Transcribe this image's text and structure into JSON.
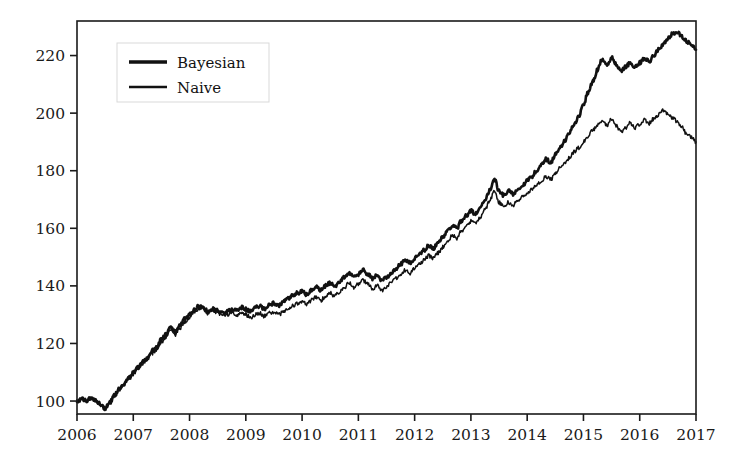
{
  "chart_data": {
    "type": "line",
    "title": "",
    "xlabel": "",
    "ylabel": "",
    "xlim": [
      2006,
      2017
    ],
    "ylim": [
      95.5,
      232
    ],
    "grid": false,
    "legend_position": "upper left",
    "xticks": [
      "2006",
      "2007",
      "2008",
      "2009",
      "2010",
      "2011",
      "2012",
      "2013",
      "2014",
      "2015",
      "2016",
      "2017"
    ],
    "yticks": [
      "100",
      "120",
      "140",
      "160",
      "180",
      "200",
      "220"
    ],
    "ytick_values": [
      100,
      120,
      140,
      160,
      180,
      200,
      220
    ],
    "xtick_values": [
      2006,
      2007,
      2008,
      2009,
      2010,
      2011,
      2012,
      2013,
      2014,
      2015,
      2016,
      2017
    ],
    "series": [
      {
        "name": "Bayesian",
        "color": "#111111",
        "linewidth": 2.6,
        "x": [
          2006.0,
          2006.08,
          2006.17,
          2006.25,
          2006.33,
          2006.42,
          2006.5,
          2006.58,
          2006.67,
          2006.75,
          2006.83,
          2006.92,
          2007.0,
          2007.08,
          2007.17,
          2007.25,
          2007.33,
          2007.42,
          2007.5,
          2007.58,
          2007.67,
          2007.75,
          2007.83,
          2007.92,
          2008.0,
          2008.08,
          2008.17,
          2008.25,
          2008.33,
          2008.42,
          2008.5,
          2008.58,
          2008.67,
          2008.75,
          2008.83,
          2008.92,
          2009.0,
          2009.08,
          2009.17,
          2009.25,
          2009.33,
          2009.42,
          2009.5,
          2009.58,
          2009.67,
          2009.75,
          2009.83,
          2009.92,
          2010.0,
          2010.08,
          2010.17,
          2010.25,
          2010.33,
          2010.42,
          2010.5,
          2010.58,
          2010.67,
          2010.75,
          2010.83,
          2010.92,
          2011.0,
          2011.08,
          2011.17,
          2011.25,
          2011.33,
          2011.42,
          2011.5,
          2011.58,
          2011.67,
          2011.75,
          2011.83,
          2011.92,
          2012.0,
          2012.08,
          2012.17,
          2012.25,
          2012.33,
          2012.42,
          2012.5,
          2012.58,
          2012.67,
          2012.75,
          2012.83,
          2012.92,
          2013.0,
          2013.08,
          2013.17,
          2013.25,
          2013.33,
          2013.42,
          2013.5,
          2013.58,
          2013.67,
          2013.75,
          2013.83,
          2013.92,
          2014.0,
          2014.08,
          2014.17,
          2014.25,
          2014.33,
          2014.42,
          2014.5,
          2014.58,
          2014.67,
          2014.75,
          2014.83,
          2014.92,
          2015.0,
          2015.08,
          2015.17,
          2015.25,
          2015.33,
          2015.42,
          2015.5,
          2015.58,
          2015.67,
          2015.75,
          2015.83,
          2015.92,
          2016.0,
          2016.08,
          2016.17,
          2016.25,
          2016.33,
          2016.42,
          2016.5,
          2016.58,
          2016.67,
          2016.75,
          2016.83,
          2016.92,
          2017.0
        ],
        "y": [
          100.0,
          100.6,
          100.2,
          101.0,
          100.4,
          99.0,
          97.2,
          99.5,
          102.0,
          104.5,
          106.0,
          108.0,
          110.0,
          111.5,
          113.5,
          115.0,
          117.5,
          119.0,
          121.5,
          123.0,
          125.5,
          124.0,
          126.5,
          128.5,
          130.0,
          131.5,
          133.0,
          132.5,
          131.0,
          132.0,
          131.5,
          130.5,
          131.0,
          132.0,
          131.5,
          132.5,
          132.0,
          131.0,
          132.5,
          133.0,
          132.0,
          133.5,
          134.0,
          133.0,
          134.5,
          135.5,
          136.5,
          137.5,
          138.0,
          137.0,
          138.5,
          139.5,
          138.5,
          140.0,
          141.0,
          140.0,
          141.5,
          143.0,
          144.5,
          143.0,
          144.0,
          145.5,
          144.0,
          142.5,
          143.5,
          142.0,
          143.0,
          144.5,
          146.0,
          147.5,
          149.0,
          148.0,
          149.5,
          151.0,
          152.5,
          154.0,
          153.0,
          155.0,
          157.0,
          159.0,
          161.0,
          160.0,
          162.5,
          164.5,
          166.0,
          165.0,
          167.5,
          170.0,
          173.0,
          177.0,
          173.0,
          171.5,
          173.0,
          172.0,
          173.5,
          175.0,
          176.5,
          178.0,
          180.0,
          182.0,
          184.0,
          183.0,
          185.5,
          188.0,
          190.5,
          193.0,
          196.0,
          199.0,
          203.0,
          207.0,
          211.0,
          215.0,
          218.5,
          216.5,
          219.5,
          217.0,
          214.5,
          216.0,
          217.5,
          216.0,
          217.5,
          219.0,
          218.0,
          220.0,
          222.0,
          224.0,
          226.0,
          227.5,
          228.0,
          226.5,
          225.0,
          223.5,
          222.0
        ]
      },
      {
        "name": "Naive",
        "color": "#111111",
        "linewidth": 1.5,
        "x": [
          2006.0,
          2006.08,
          2006.17,
          2006.25,
          2006.33,
          2006.42,
          2006.5,
          2006.58,
          2006.67,
          2006.75,
          2006.83,
          2006.92,
          2007.0,
          2007.08,
          2007.17,
          2007.25,
          2007.33,
          2007.42,
          2007.5,
          2007.58,
          2007.67,
          2007.75,
          2007.83,
          2007.92,
          2008.0,
          2008.08,
          2008.17,
          2008.25,
          2008.33,
          2008.42,
          2008.5,
          2008.58,
          2008.67,
          2008.75,
          2008.83,
          2008.92,
          2009.0,
          2009.08,
          2009.17,
          2009.25,
          2009.33,
          2009.42,
          2009.5,
          2009.58,
          2009.67,
          2009.75,
          2009.83,
          2009.92,
          2010.0,
          2010.08,
          2010.17,
          2010.25,
          2010.33,
          2010.42,
          2010.5,
          2010.58,
          2010.67,
          2010.75,
          2010.83,
          2010.92,
          2011.0,
          2011.08,
          2011.17,
          2011.25,
          2011.33,
          2011.42,
          2011.5,
          2011.58,
          2011.67,
          2011.75,
          2011.83,
          2011.92,
          2012.0,
          2012.08,
          2012.17,
          2012.25,
          2012.33,
          2012.42,
          2012.5,
          2012.58,
          2012.67,
          2012.75,
          2012.83,
          2012.92,
          2013.0,
          2013.08,
          2013.17,
          2013.25,
          2013.33,
          2013.42,
          2013.5,
          2013.58,
          2013.67,
          2013.75,
          2013.83,
          2013.92,
          2014.0,
          2014.08,
          2014.17,
          2014.25,
          2014.33,
          2014.42,
          2014.5,
          2014.58,
          2014.67,
          2014.75,
          2014.83,
          2014.92,
          2015.0,
          2015.08,
          2015.17,
          2015.25,
          2015.33,
          2015.42,
          2015.5,
          2015.58,
          2015.67,
          2015.75,
          2015.83,
          2015.92,
          2016.0,
          2016.08,
          2016.17,
          2016.25,
          2016.33,
          2016.42,
          2016.5,
          2016.58,
          2016.67,
          2016.75,
          2016.83,
          2016.92,
          2017.0
        ],
        "y": [
          100.0,
          100.4,
          100.0,
          100.8,
          100.2,
          98.6,
          97.0,
          99.2,
          101.6,
          104.0,
          105.5,
          107.4,
          109.4,
          110.8,
          112.8,
          114.2,
          116.5,
          118.0,
          120.5,
          122.0,
          124.5,
          123.0,
          125.5,
          127.5,
          129.2,
          130.8,
          132.4,
          132.0,
          130.4,
          131.4,
          130.8,
          129.8,
          130.0,
          130.8,
          130.0,
          130.5,
          130.0,
          129.0,
          130.0,
          130.5,
          129.5,
          130.5,
          131.0,
          130.0,
          131.0,
          132.0,
          133.0,
          134.0,
          134.5,
          133.5,
          135.0,
          136.0,
          135.0,
          136.5,
          137.5,
          136.5,
          138.0,
          139.5,
          141.0,
          139.5,
          140.5,
          142.0,
          140.5,
          139.0,
          140.0,
          138.5,
          139.5,
          141.0,
          142.5,
          144.0,
          145.5,
          144.5,
          146.0,
          147.5,
          149.0,
          150.5,
          149.5,
          151.5,
          153.5,
          155.5,
          157.5,
          156.5,
          159.0,
          161.0,
          162.5,
          161.5,
          164.0,
          166.5,
          169.5,
          173.0,
          169.0,
          167.5,
          169.0,
          168.0,
          169.5,
          171.0,
          172.0,
          173.5,
          175.0,
          176.5,
          178.0,
          177.0,
          179.0,
          181.0,
          183.0,
          184.5,
          186.5,
          188.0,
          190.0,
          192.0,
          194.0,
          196.0,
          197.5,
          195.5,
          198.0,
          195.5,
          193.5,
          195.0,
          196.5,
          195.0,
          196.0,
          197.5,
          196.5,
          198.0,
          199.5,
          201.0,
          200.0,
          198.5,
          197.0,
          195.0,
          193.0,
          191.5,
          190.0
        ]
      }
    ]
  },
  "legend": {
    "entries": [
      {
        "label": "Bayesian"
      },
      {
        "label": "Naive"
      }
    ]
  },
  "axes": {
    "frame_color": "#1a1a1a",
    "tick_color": "#1a1a1a"
  }
}
